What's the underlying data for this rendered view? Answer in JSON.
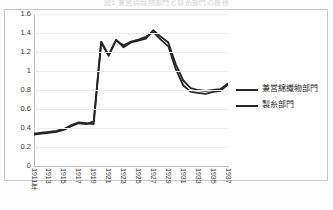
{
  "chart_title": "図1 兼営綿織物部門と製糸部門の推移",
  "legend": {
    "items": [
      {
        "label": "兼営綿織物部門",
        "color": "#262626",
        "swatch": "line-swatch"
      },
      {
        "label": "製糸部門",
        "color": "#262626",
        "swatch": "line-swatch"
      }
    ]
  },
  "axis": {
    "y_ticks": [
      "0",
      "0.2",
      "0.4",
      "0.6",
      "0.8",
      "1",
      "1.2",
      "1.4",
      "1.6"
    ],
    "x_ticks": [
      "1911年",
      "1913",
      "1915",
      "1917",
      "1919",
      "1921",
      "1923",
      "1925",
      "1927",
      "1929",
      "1931",
      "1933",
      "1935",
      "1937"
    ]
  },
  "chart_data": {
    "type": "line",
    "title": "図1 兼営綿織物部門と製糸部門の推移",
    "xlabel": "",
    "ylabel": "",
    "ylim": [
      0,
      1.6
    ],
    "xlim": [
      1911,
      1937
    ],
    "grid": true,
    "legend_position": "right",
    "x": [
      1911,
      1912,
      1913,
      1914,
      1915,
      1916,
      1917,
      1918,
      1919,
      1920,
      1921,
      1922,
      1923,
      1924,
      1925,
      1926,
      1927,
      1928,
      1929,
      1930,
      1931,
      1932,
      1933,
      1934,
      1935,
      1936,
      1937
    ],
    "categories": [
      "1911年",
      "1912",
      "1913",
      "1914",
      "1915",
      "1916",
      "1917",
      "1918",
      "1919",
      "1920",
      "1921",
      "1922",
      "1923",
      "1924",
      "1925",
      "1926",
      "1927",
      "1928",
      "1929",
      "1930",
      "1931",
      "1932",
      "1933",
      "1934",
      "1935",
      "1936",
      "1937"
    ],
    "series": [
      {
        "name": "兼営綿織物部門",
        "color": "#262626",
        "values": [
          0.33,
          0.34,
          0.35,
          0.36,
          0.38,
          0.42,
          0.45,
          0.44,
          0.47,
          1.31,
          1.17,
          1.33,
          1.25,
          1.3,
          1.32,
          1.34,
          1.43,
          1.36,
          1.3,
          1.07,
          0.9,
          0.82,
          0.8,
          0.79,
          0.8,
          0.81,
          0.87
        ]
      },
      {
        "name": "製糸部門",
        "color": "#262626",
        "values": [
          0.34,
          0.35,
          0.36,
          0.37,
          0.39,
          0.43,
          0.46,
          0.45,
          0.44,
          1.3,
          1.16,
          1.32,
          1.27,
          1.31,
          1.33,
          1.36,
          1.41,
          1.33,
          1.26,
          1.02,
          0.85,
          0.78,
          0.77,
          0.76,
          0.78,
          0.79,
          0.86
        ]
      }
    ]
  }
}
